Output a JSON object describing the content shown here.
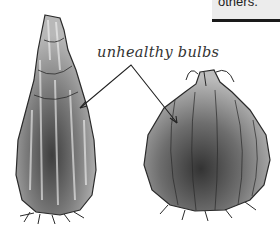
{
  "callout": {
    "text": "others."
  },
  "illustration": {
    "label": "unhealthy bulbs",
    "subjects": [
      "elongated-bulb",
      "round-bulb"
    ],
    "colors": {
      "ink": "#2a2a2a",
      "wash_dark": "#4a4a4a",
      "wash_mid": "#8a8a8a",
      "wash_light": "#c4c4c4",
      "background": "#ffffff"
    }
  }
}
